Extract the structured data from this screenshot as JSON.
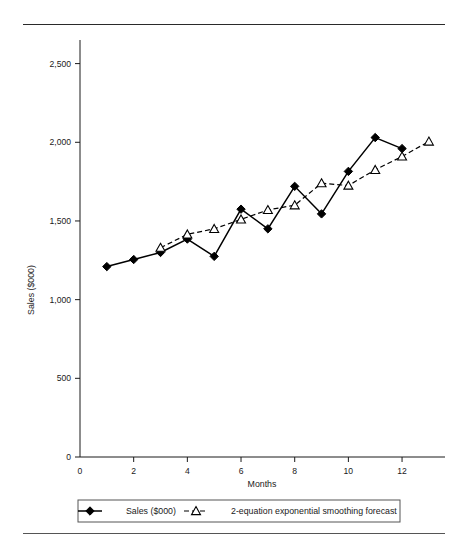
{
  "chart_data": {
    "type": "line",
    "title": "",
    "xlabel": "Months",
    "ylabel": "Sales ($000)",
    "xlim": [
      0,
      13.6
    ],
    "ylim": [
      0,
      2650
    ],
    "grid": false,
    "legend_position": "bottom",
    "x_ticks": [
      "0",
      "2",
      "4",
      "6",
      "8",
      "10",
      "12"
    ],
    "x_tick_values": [
      0,
      2,
      4,
      6,
      8,
      10,
      12
    ],
    "y_ticks": [
      "0",
      "500",
      "1,000",
      "1,500",
      "2,000",
      "2,500"
    ],
    "y_tick_values": [
      0,
      500,
      1000,
      1500,
      2000,
      2500
    ],
    "series": [
      {
        "name": "Sales ($000)",
        "marker": "filled-diamond",
        "line_style": "solid",
        "color": "#000000",
        "x": [
          1,
          2,
          3,
          4,
          5,
          6,
          7,
          8,
          9,
          10,
          11,
          12
        ],
        "values": [
          1210,
          1255,
          1300,
          1385,
          1275,
          1575,
          1450,
          1720,
          1545,
          1815,
          2030,
          1960
        ]
      },
      {
        "name": "2-equation exponential smoothing forecast",
        "marker": "open-triangle",
        "line_style": "dashed",
        "color": "#000000",
        "x": [
          3,
          4,
          5,
          6,
          7,
          8,
          9,
          10,
          11,
          12,
          13
        ],
        "values": [
          1330,
          1415,
          1450,
          1510,
          1570,
          1600,
          1740,
          1725,
          1825,
          1910,
          2005
        ]
      }
    ]
  },
  "legend": {
    "entries": [
      {
        "label": "Sales ($000)",
        "marker": "filled-diamond",
        "style": "solid"
      },
      {
        "label": "2-equation exponential smoothing forecast",
        "marker": "open-triangle",
        "style": "dashed"
      }
    ]
  },
  "axes": {
    "x_title": "Months",
    "y_title": "Sales ($000)"
  }
}
